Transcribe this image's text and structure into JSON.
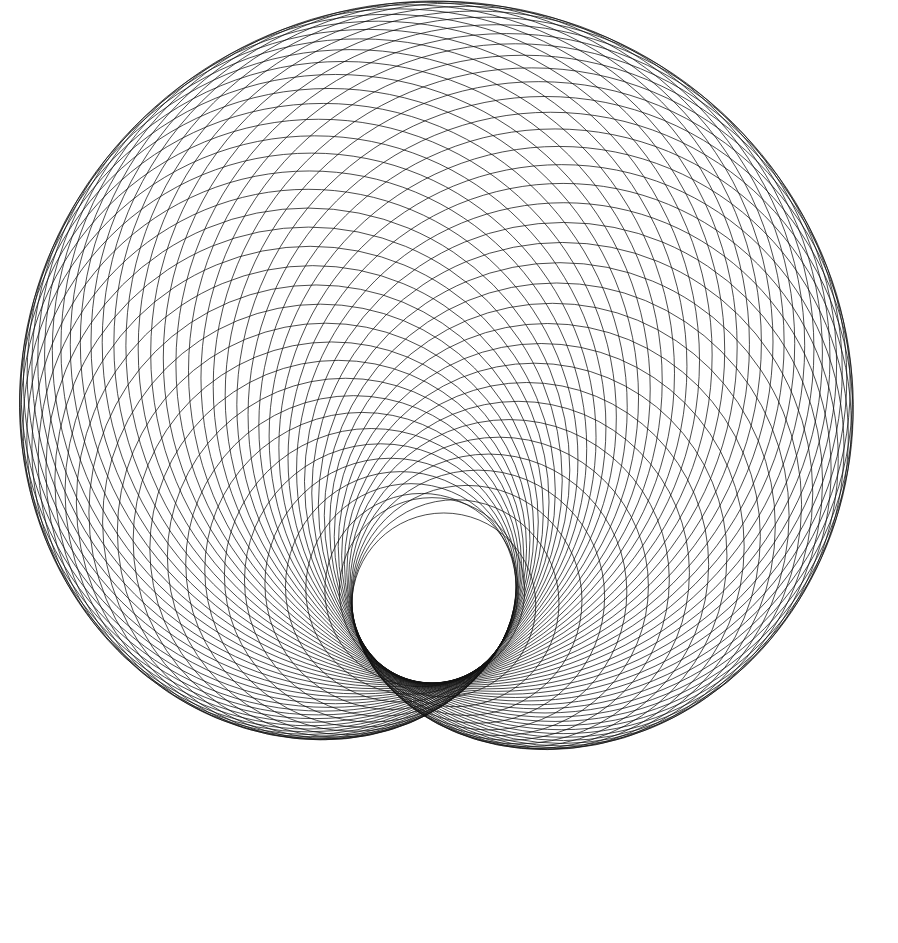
{
  "canvas": {
    "width": 898,
    "height": 943,
    "background": "#ffffff"
  },
  "pattern": {
    "type": "circle-envelope",
    "stroke_color": "#111111",
    "stroke_width": 0.9,
    "stroke_opacity": 0.85,
    "circle_count": 72,
    "hub": {
      "cx": 432,
      "cy": 470
    },
    "orbit_radius": 128,
    "hole": {
      "cx": 432,
      "cy": 603,
      "r": 80
    },
    "spiral_drift": 0.12,
    "start_angle_deg": 90
  }
}
